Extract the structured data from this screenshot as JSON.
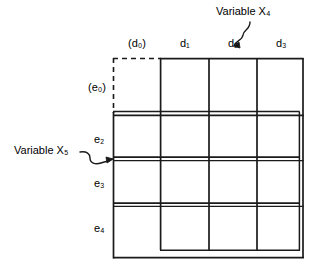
{
  "figure": {
    "type": "karnaugh-map-grid-diagram",
    "background_color": "#ffffff",
    "line_color": "#1a1a1a"
  },
  "column_labels": [
    {
      "id": "d0",
      "text": "(d₀)",
      "base": "d",
      "sub": "0",
      "parenthesized": true,
      "x": 128,
      "y": 44
    },
    {
      "id": "d1",
      "text": "d₁",
      "base": "d",
      "sub": "1",
      "parenthesized": false,
      "x": 180,
      "y": 44
    },
    {
      "id": "d2",
      "text": "d₂",
      "base": "d",
      "sub": "2",
      "parenthesized": false,
      "x": 228,
      "y": 44
    },
    {
      "id": "d3",
      "text": "d₃",
      "base": "d",
      "sub": "3",
      "parenthesized": false,
      "x": 276,
      "y": 44
    }
  ],
  "row_labels": [
    {
      "id": "e0",
      "text": "(e₀)",
      "base": "e",
      "sub": "0",
      "parenthesized": true,
      "x": 88,
      "y": 88
    },
    {
      "id": "e2",
      "text": "e₂",
      "base": "e",
      "sub": "2",
      "parenthesized": false,
      "x": 93,
      "y": 140
    },
    {
      "id": "e3",
      "text": "e₃",
      "base": "e",
      "sub": "3",
      "parenthesized": false,
      "x": 93,
      "y": 184
    },
    {
      "id": "e4",
      "text": "e₄",
      "base": "e",
      "sub": "4",
      "parenthesized": false,
      "x": 93,
      "y": 229
    }
  ],
  "annotations": [
    {
      "id": "variable-x4",
      "text": "Variable X₄",
      "base": "Variable X",
      "sub": "4",
      "x": 216,
      "y": 11,
      "points_to": "vertical-divider-between-d2-and-d3"
    },
    {
      "id": "variable-x5",
      "text": "Variable X₅",
      "base": "Variable X",
      "sub": "5",
      "x": 14,
      "y": 150,
      "points_to": "horizontal-divider-between-e2-and-e3"
    }
  ],
  "grid": {
    "rows": 4,
    "columns": 4,
    "outer_left": 113,
    "outer_top": 58,
    "outer_right": 303,
    "outer_bottom": 258,
    "column_boundaries": [
      113,
      161,
      209,
      257,
      303
    ],
    "row_boundaries": [
      58,
      113,
      157,
      203,
      258
    ],
    "dashed_edges": [
      "top-left-cell-top",
      "top-left-cell-left"
    ],
    "inner_bottom_offset": 250,
    "inner_right_offset": 299
  }
}
